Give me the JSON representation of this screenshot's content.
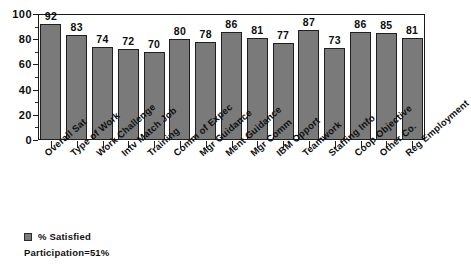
{
  "chart_data": {
    "type": "bar",
    "title": "",
    "xlabel": "",
    "ylabel": "",
    "ylim": [
      0,
      100
    ],
    "y_major_ticks": [
      0,
      20,
      40,
      60,
      80,
      100
    ],
    "y_minor_ticks": [
      10,
      30,
      50,
      70,
      90
    ],
    "grid": false,
    "legend_position": "bottom-left",
    "categories": [
      "Overall Sat",
      "Type of Work",
      "Work Challenge",
      "Intv Match Job",
      "Training",
      "Comm of Expec",
      "Mgr Guidance",
      "Ment Guidance",
      "Mgr Comm",
      "IBM Opport",
      "Teamwork",
      "Staffing Info",
      "Coop Objective",
      "Other Co.",
      "Reg Employment"
    ],
    "series": [
      {
        "name": "% Satisfied",
        "color": "#7a7a7a",
        "values": [
          92,
          83,
          74,
          72,
          70,
          80,
          78,
          86,
          81,
          77,
          87,
          73,
          86,
          85,
          81
        ]
      }
    ],
    "annotations": [
      "Participation=51%"
    ]
  },
  "legend": {
    "series_label": "% Satisfied",
    "participation": "Participation=51%",
    "swatch_color": "#7a7a7a"
  },
  "axis": {
    "y_labels": [
      "100",
      "80",
      "60",
      "40",
      "20",
      "0"
    ]
  }
}
